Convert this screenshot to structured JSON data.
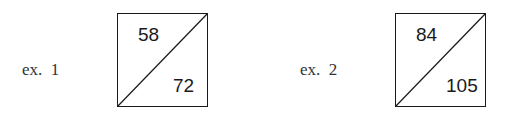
{
  "examples": [
    {
      "label": "ex.  1",
      "top_value": "58",
      "bottom_value": "72"
    },
    {
      "label": "ex.  2",
      "top_value": "84",
      "bottom_value": "105"
    }
  ],
  "colors": {
    "line": "#1a1a1a",
    "label_text": "#333333",
    "background": "#ffffff"
  }
}
